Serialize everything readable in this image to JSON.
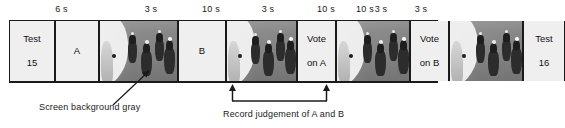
{
  "figure": {
    "type": "experimental-trial-timeline",
    "durations": [
      {
        "label": "6 s",
        "left": 9,
        "width": 118
      },
      {
        "label": "3 s",
        "left": 127,
        "width": 50
      },
      {
        "label": "10 s",
        "left": 177,
        "width": 72
      },
      {
        "label": "3 s",
        "left": 249,
        "width": 40
      },
      {
        "label": "10 s",
        "left": 289,
        "width": 72
      },
      {
        "label": "3 s",
        "left": 361,
        "width": 40
      },
      {
        "label": "10 s",
        "left": 347,
        "width": 72
      },
      {
        "label": "3 s",
        "left": 405,
        "width": 33
      }
    ],
    "panels": [
      {
        "kind": "text",
        "name": "panel-test-15",
        "left": 9,
        "width": 46,
        "lines": [
          "Test",
          "15"
        ]
      },
      {
        "kind": "text",
        "name": "panel-stimulus-a-label",
        "left": 55,
        "width": 44,
        "lines": [
          "",
          "A"
        ]
      },
      {
        "kind": "video",
        "name": "panel-video-a-1",
        "left": 99,
        "width": 79,
        "alt": "horse race footage"
      },
      {
        "kind": "text",
        "name": "panel-stimulus-b-label",
        "left": 178,
        "width": 48,
        "lines": [
          "",
          "B"
        ]
      },
      {
        "kind": "video",
        "name": "panel-video-b-1",
        "left": 226,
        "width": 71,
        "alt": "horse race footage"
      },
      {
        "kind": "text",
        "name": "panel-vote-on-a",
        "left": 297,
        "width": 39,
        "lines": [
          "Vote",
          "on A"
        ]
      },
      {
        "kind": "video",
        "name": "panel-video-a-2",
        "left": 336,
        "width": 74,
        "alt": "horse race footage"
      },
      {
        "kind": "text",
        "name": "panel-vote-on-b",
        "left": 410,
        "width": 39,
        "lines": [
          "Vote",
          "on B"
        ]
      },
      {
        "kind": "video",
        "name": "panel-video-b-2",
        "left": 449,
        "width": 74,
        "alt": "horse race footage"
      },
      {
        "kind": "text",
        "name": "panel-test-16",
        "left": 523,
        "width": 42,
        "lines": [
          "Test",
          "16"
        ]
      }
    ],
    "annotations": {
      "background_note": "Screen background gray",
      "record_note": "Record judgement of A and B"
    }
  }
}
